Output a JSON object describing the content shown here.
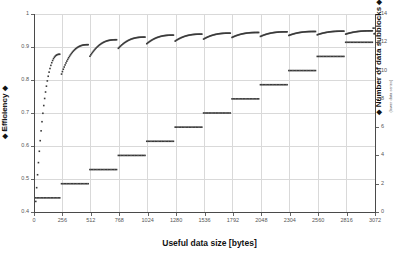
{
  "chart_data": {
    "type": "scatter",
    "title": "",
    "xlabel": "Useful data size [bytes]",
    "xlim": [
      0,
      3072
    ],
    "grid": true,
    "legend_position": "none",
    "axes": {
      "left": {
        "label": "Efficiency",
        "sublabel": "(upper data series)",
        "arrow_prefix": "◆",
        "arrow_suffix": "◆",
        "lim": [
          0.4,
          1.0
        ],
        "ticks": [
          "0.4",
          "0.5",
          "0.6",
          "0.7",
          "0.8",
          "0.9",
          "1"
        ],
        "tick_values": [
          0.4,
          0.5,
          0.6,
          0.7,
          0.8,
          0.9,
          1.0
        ]
      },
      "right": {
        "label": "Number of data subblocks",
        "sublabel": "(lower data series)",
        "arrow_prefix": "◆",
        "arrow_suffix": "◆",
        "lim": [
          0,
          14
        ],
        "ticks": [
          "0",
          "2",
          "4",
          "6",
          "8",
          "10",
          "12",
          "14"
        ],
        "tick_values": [
          0,
          2,
          4,
          6,
          8,
          10,
          12,
          14
        ]
      }
    },
    "x_ticks": [
      "0",
      "256",
      "512",
      "768",
      "1024",
      "1280",
      "1536",
      "1792",
      "2048",
      "2304",
      "2560",
      "2816",
      "3072"
    ],
    "x_tick_values": [
      0,
      256,
      512,
      768,
      1024,
      1280,
      1536,
      1792,
      2048,
      2304,
      2560,
      2816,
      3072
    ],
    "marker": {
      "shape": "square",
      "size_px": 1.6,
      "color": "#3a3a3a"
    },
    "series": [
      {
        "name": "Efficiency",
        "axis": "left",
        "segments": [
          {
            "x_start": 16,
            "x_end": 232,
            "y_start": 0.432,
            "y_end": 0.878,
            "n": 28,
            "curve": "saturating"
          },
          {
            "x_start": 248,
            "x_end": 488,
            "y_start": 0.818,
            "y_end": 0.907,
            "n": 31,
            "curve": "saturating"
          },
          {
            "x_start": 504,
            "x_end": 744,
            "y_start": 0.872,
            "y_end": 0.922,
            "n": 31,
            "curve": "saturating"
          },
          {
            "x_start": 760,
            "x_end": 1000,
            "y_start": 0.896,
            "y_end": 0.93,
            "n": 31,
            "curve": "saturating"
          },
          {
            "x_start": 1016,
            "x_end": 1256,
            "y_start": 0.91,
            "y_end": 0.936,
            "n": 31,
            "curve": "saturating"
          },
          {
            "x_start": 1272,
            "x_end": 1512,
            "y_start": 0.918,
            "y_end": 0.939,
            "n": 31,
            "curve": "saturating"
          },
          {
            "x_start": 1528,
            "x_end": 1768,
            "y_start": 0.924,
            "y_end": 0.942,
            "n": 31,
            "curve": "saturating"
          },
          {
            "x_start": 1784,
            "x_end": 2024,
            "y_start": 0.929,
            "y_end": 0.944,
            "n": 31,
            "curve": "saturating"
          },
          {
            "x_start": 2040,
            "x_end": 2280,
            "y_start": 0.932,
            "y_end": 0.946,
            "n": 31,
            "curve": "saturating"
          },
          {
            "x_start": 2296,
            "x_end": 2536,
            "y_start": 0.935,
            "y_end": 0.947,
            "n": 31,
            "curve": "saturating"
          },
          {
            "x_start": 2552,
            "x_end": 2792,
            "y_start": 0.937,
            "y_end": 0.948,
            "n": 31,
            "curve": "saturating"
          },
          {
            "x_start": 2808,
            "x_end": 3048,
            "y_start": 0.939,
            "y_end": 0.949,
            "n": 31,
            "curve": "saturating"
          },
          {
            "x_start": 3064,
            "x_end": 3072,
            "y_start": 0.94,
            "y_end": 0.941,
            "n": 2,
            "curve": "saturating"
          }
        ]
      },
      {
        "name": "Number of data subblocks",
        "axis": "right",
        "steps": [
          {
            "x_start": 16,
            "x_end": 232,
            "value": 1
          },
          {
            "x_start": 248,
            "x_end": 488,
            "value": 2
          },
          {
            "x_start": 504,
            "x_end": 744,
            "value": 3
          },
          {
            "x_start": 760,
            "x_end": 1000,
            "value": 4
          },
          {
            "x_start": 1016,
            "x_end": 1256,
            "value": 5
          },
          {
            "x_start": 1272,
            "x_end": 1512,
            "value": 6
          },
          {
            "x_start": 1528,
            "x_end": 1768,
            "value": 7
          },
          {
            "x_start": 1784,
            "x_end": 2024,
            "value": 8
          },
          {
            "x_start": 2040,
            "x_end": 2280,
            "value": 9
          },
          {
            "x_start": 2296,
            "x_end": 2536,
            "value": 10
          },
          {
            "x_start": 2552,
            "x_end": 2792,
            "value": 11
          },
          {
            "x_start": 2808,
            "x_end": 3048,
            "value": 12
          },
          {
            "x_start": 3056,
            "x_end": 3072,
            "value": 13
          }
        ]
      }
    ],
    "colors": {
      "marker": "#3a3a3a",
      "grid": "#d9d9d9",
      "axis": "#4a4a4a",
      "background": "#ffffff",
      "tick_text": "#555555",
      "title_text": "#111111"
    }
  }
}
